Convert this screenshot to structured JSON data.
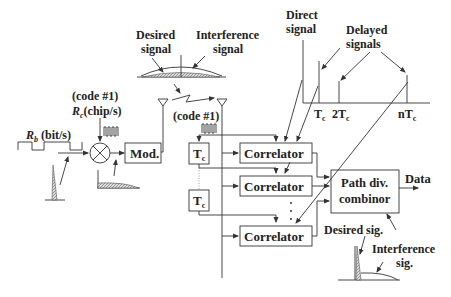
{
  "diagram": {
    "type": "DS-CDMA RAKE receiver block diagram",
    "labels": {
      "desired_signal": [
        "Desired",
        "signal"
      ],
      "interference_signal": [
        "Interference",
        "signal"
      ],
      "direct_signal": [
        "Direct",
        "signal"
      ],
      "delayed_signals": [
        "Delayed",
        "signals"
      ],
      "code_tx": "(code #1)",
      "rc": "R",
      "rc_sub": "c",
      "rc_unit": "(chip/s)",
      "rb": "R",
      "rb_sub": "b",
      "rb_unit": " (bit/s)",
      "code_rx": "(code #1)",
      "data": "Data",
      "desired_sig": "Desired sig.",
      "interference_sig": [
        "Interference",
        "sig."
      ]
    },
    "blocks": {
      "mod": "Mod.",
      "tc1": "T",
      "tc2": "T",
      "tc_sub": "c",
      "correlator1": "Correlator",
      "correlator2": "Correlator",
      "correlator3": "Correlator",
      "combiner": [
        "Path div.",
        "combinor"
      ]
    },
    "axis_ticks": {
      "t1": "T",
      "t2": "2T",
      "tn": "nT",
      "sub": "c"
    }
  }
}
